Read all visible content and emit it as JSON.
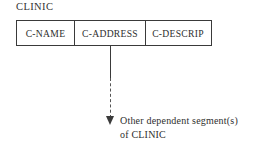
{
  "diagram": {
    "type": "ims-hierarchical-segment",
    "segment_title": "CLINIC",
    "fields": [
      {
        "label": "C-NAME"
      },
      {
        "label": "C-ADDRESS"
      },
      {
        "label": "C-DESCRIP"
      }
    ],
    "connector": {
      "style": "solid-then-dashed",
      "arrow": "filled-down-triangle"
    },
    "caption": {
      "line1": "Other dependent segment(s)",
      "line2": "of CLINIC"
    },
    "colors": {
      "background": "#ffffff",
      "stroke": "#3a3a3a",
      "dashed_stroke": "#555555",
      "text": "#2e2e2e"
    }
  }
}
